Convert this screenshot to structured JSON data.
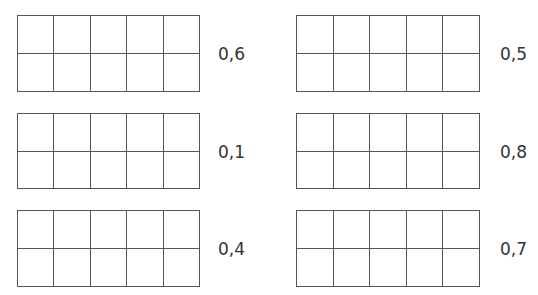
{
  "exercise": {
    "rows": 2,
    "cols": 5,
    "items": [
      {
        "label": "0,6",
        "grid": {
          "x": 17,
          "y": 15,
          "w": 183,
          "h": 77
        },
        "label_pos": {
          "x": 218,
          "y": 46
        }
      },
      {
        "label": "0,5",
        "grid": {
          "x": 296,
          "y": 15,
          "w": 184,
          "h": 77
        },
        "label_pos": {
          "x": 500,
          "y": 46
        }
      },
      {
        "label": "0,1",
        "grid": {
          "x": 17,
          "y": 113,
          "w": 183,
          "h": 76
        },
        "label_pos": {
          "x": 218,
          "y": 144
        }
      },
      {
        "label": "0,8",
        "grid": {
          "x": 296,
          "y": 113,
          "w": 184,
          "h": 76
        },
        "label_pos": {
          "x": 500,
          "y": 144
        }
      },
      {
        "label": "0,4",
        "grid": {
          "x": 17,
          "y": 210,
          "w": 183,
          "h": 77
        },
        "label_pos": {
          "x": 218,
          "y": 241
        }
      },
      {
        "label": "0,7",
        "grid": {
          "x": 296,
          "y": 210,
          "w": 184,
          "h": 77
        },
        "label_pos": {
          "x": 500,
          "y": 241
        }
      }
    ]
  }
}
